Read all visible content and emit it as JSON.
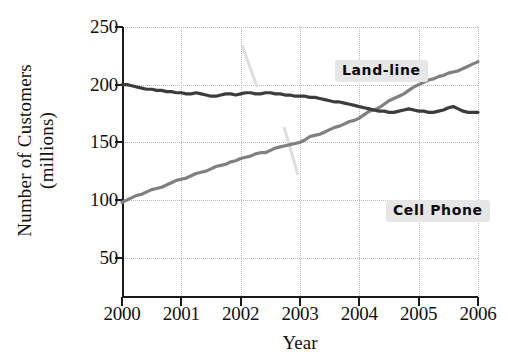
{
  "chart_data": {
    "type": "line",
    "title": "",
    "xlabel": "Year",
    "ylabel": "Number of Customers (millions)",
    "ylabel_lines": [
      "Number of Customers",
      "(millions)"
    ],
    "xlim": [
      2000,
      2006
    ],
    "ylim": [
      15,
      250
    ],
    "yticks": [
      250,
      200,
      150,
      100,
      50
    ],
    "xticks": [
      "2000",
      "2001",
      "2002",
      "2003",
      "2004",
      "2005",
      "2006"
    ],
    "grid": true,
    "legend": "annotations-on-plot",
    "series": [
      {
        "name": "Land-line",
        "color": "#3c3c3c",
        "x": [
          2000,
          2000.083,
          2000.167,
          2000.25,
          2000.333,
          2000.417,
          2000.5,
          2000.583,
          2000.667,
          2000.75,
          2000.833,
          2000.917,
          2001,
          2001.083,
          2001.167,
          2001.25,
          2001.333,
          2001.417,
          2001.5,
          2001.583,
          2001.667,
          2001.75,
          2001.833,
          2001.917,
          2002,
          2002.083,
          2002.167,
          2002.25,
          2002.333,
          2002.417,
          2002.5,
          2002.583,
          2002.667,
          2002.75,
          2002.833,
          2002.917,
          2003,
          2003.083,
          2003.167,
          2003.25,
          2003.333,
          2003.417,
          2003.5,
          2003.583,
          2003.667,
          2003.75,
          2003.833,
          2003.917,
          2004,
          2004.083,
          2004.167,
          2004.25,
          2004.333,
          2004.417,
          2004.5,
          2004.583,
          2004.667,
          2004.75,
          2004.833,
          2004.917,
          2005,
          2005.083,
          2005.167,
          2005.25,
          2005.333,
          2005.417,
          2005.5,
          2005.583,
          2005.667,
          2005.75,
          2005.833,
          2005.917,
          2006
        ],
        "values": [
          200,
          200,
          199,
          198,
          197,
          196,
          196,
          195,
          195,
          194,
          194,
          193,
          193,
          192,
          192,
          193,
          192,
          191,
          190,
          190,
          191,
          192,
          192,
          191,
          192,
          193,
          193,
          192,
          192,
          193,
          193,
          192,
          192,
          191,
          191,
          190,
          190,
          190,
          189,
          189,
          188,
          187,
          186,
          185,
          185,
          184,
          183,
          182,
          181,
          180,
          179,
          178,
          177,
          177,
          176,
          176,
          177,
          178,
          179,
          178,
          177,
          177,
          176,
          176,
          177,
          178,
          180,
          181,
          179,
          177,
          176,
          176,
          176
        ]
      },
      {
        "name": "Cell Phone",
        "color": "#808080",
        "x": [
          2000,
          2000.083,
          2000.167,
          2000.25,
          2000.333,
          2000.417,
          2000.5,
          2000.583,
          2000.667,
          2000.75,
          2000.833,
          2000.917,
          2001,
          2001.083,
          2001.167,
          2001.25,
          2001.333,
          2001.417,
          2001.5,
          2001.583,
          2001.667,
          2001.75,
          2001.833,
          2001.917,
          2002,
          2002.083,
          2002.167,
          2002.25,
          2002.333,
          2002.417,
          2002.5,
          2002.583,
          2002.667,
          2002.75,
          2002.833,
          2002.917,
          2003,
          2003.083,
          2003.167,
          2003.25,
          2003.333,
          2003.417,
          2003.5,
          2003.583,
          2003.667,
          2003.75,
          2003.833,
          2003.917,
          2004,
          2004.083,
          2004.167,
          2004.25,
          2004.333,
          2004.417,
          2004.5,
          2004.583,
          2004.667,
          2004.75,
          2004.833,
          2004.917,
          2005,
          2005.083,
          2005.167,
          2005.25,
          2005.333,
          2005.417,
          2005.5,
          2005.583,
          2005.667,
          2005.75,
          2005.833,
          2005.917,
          2006
        ],
        "values": [
          98,
          100,
          102,
          104,
          105,
          107,
          109,
          110,
          111,
          113,
          115,
          117,
          118,
          119,
          121,
          123,
          124,
          125,
          127,
          129,
          130,
          131,
          133,
          134,
          136,
          137,
          138,
          140,
          141,
          141,
          143,
          145,
          146,
          147,
          148,
          149,
          150,
          152,
          155,
          156,
          157,
          159,
          161,
          163,
          164,
          166,
          168,
          169,
          171,
          174,
          177,
          178,
          180,
          183,
          186,
          188,
          190,
          192,
          195,
          198,
          200,
          202,
          204,
          205,
          207,
          208,
          210,
          211,
          212,
          214,
          216,
          218,
          220
        ]
      }
    ],
    "annotations": [
      {
        "text": "Land-line",
        "series": "Land-line"
      },
      {
        "text": "Cell Phone",
        "series": "Cell Phone"
      }
    ]
  },
  "axes": {
    "ylabel_line1": "Number of Customers",
    "ylabel_line2": "(millions)",
    "xlabel": "Year",
    "yticks": [
      "250",
      "200",
      "150",
      "100",
      "50"
    ],
    "xticks": [
      "2000",
      "2001",
      "2002",
      "2003",
      "2004",
      "2005",
      "2006"
    ]
  },
  "annotations": {
    "landline": "Land-line",
    "cellphone": "Cell Phone"
  },
  "colors": {
    "landline": "#3c3c3c",
    "cellphone": "#808080",
    "axis": "#1a1a1a",
    "grid": "#b9b9b9",
    "annotation_background": "#e6e6e6",
    "background": "#ffffff"
  }
}
